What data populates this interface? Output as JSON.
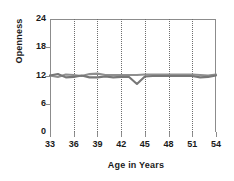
{
  "chart_data": {
    "type": "line",
    "title": "",
    "xlabel": "Age in Years",
    "ylabel": "Openness",
    "xlim": [
      33,
      54
    ],
    "ylim": [
      0,
      24
    ],
    "yticks": [
      0,
      6,
      12,
      18,
      24
    ],
    "xticks": [
      33,
      36,
      39,
      42,
      45,
      48,
      51,
      54
    ],
    "grid": "vertical-dotted",
    "legend": "none",
    "x": [
      33,
      34,
      35,
      36,
      37,
      38,
      39,
      40,
      41,
      42,
      43,
      44,
      45,
      46,
      47,
      48,
      49,
      50,
      51,
      52,
      53,
      54
    ],
    "series": [
      {
        "name": "series-1",
        "color": "#8f8f8f",
        "values": [
          12.0,
          11.7,
          12.2,
          12.1,
          11.9,
          12.3,
          12.4,
          12.1,
          12.1,
          12.1,
          12.1,
          12.1,
          12.2,
          12.2,
          12.2,
          12.2,
          12.2,
          12.2,
          12.2,
          12.1,
          12.0,
          12.2
        ]
      },
      {
        "name": "series-2",
        "color": "#777777",
        "values": [
          12.0,
          12.3,
          11.6,
          11.7,
          12.0,
          11.6,
          11.6,
          11.8,
          11.6,
          11.7,
          11.7,
          10.2,
          11.8,
          11.9,
          11.9,
          11.9,
          11.9,
          11.9,
          11.9,
          11.6,
          11.7,
          12.0
        ]
      }
    ]
  },
  "axis": {
    "ytick_labels": [
      "0",
      "6",
      "12",
      "18",
      "24"
    ],
    "xtick_labels": [
      "33",
      "36",
      "39",
      "42",
      "45",
      "48",
      "51",
      "54"
    ],
    "x_title": "Age in Years",
    "y_title": "Openness"
  }
}
